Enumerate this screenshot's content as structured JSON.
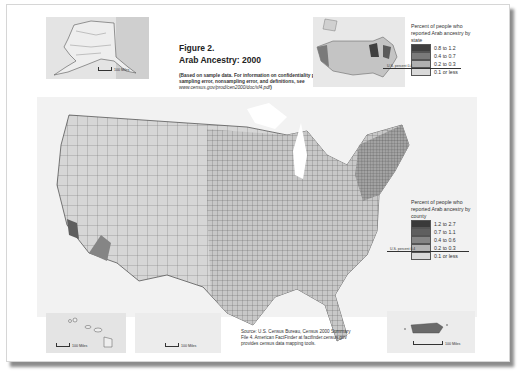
{
  "figure": {
    "number": "Figure 2.",
    "title": "Arab Ancestry: 2000",
    "note_bold": "(Based on sample data. For information on confidentiality protection, sampling error, nonsampling error, and definitions, see ",
    "note_url": "www.census.gov/prod/cen2000/doc/sf4.pdf",
    "note_end": ")"
  },
  "state_legend": {
    "title": "Percent of people who reported Arab ancestry by state",
    "us_percent_label": "U.S. percent 0.4",
    "classes": [
      {
        "label": "0.8 to 1.2",
        "color": "#3f3f3f"
      },
      {
        "label": "0.4 to 0.7",
        "color": "#7a7a7a"
      },
      {
        "label": "0.2 to 0.3",
        "color": "#b0b0b0"
      },
      {
        "label": "0.1 or less",
        "color": "#d9d9d9"
      }
    ]
  },
  "county_legend": {
    "title": "Percent of people who reported Arab ancestry by county",
    "us_percent_label": "U.S. percent 0.4",
    "classes": [
      {
        "label": "1.2 to 2.7",
        "color": "#3a3a3a"
      },
      {
        "label": "0.7 to 1.1",
        "color": "#5f5f5f"
      },
      {
        "label": "0.4 to 0.6",
        "color": "#858585"
      },
      {
        "label": "0.2 to 0.3",
        "color": "#b2b2b2"
      },
      {
        "label": "0.1 or less",
        "color": "#dadada"
      }
    ]
  },
  "source": "Source: U.S. Census Bureau, Census 2000 Summary File 4. American FactFinder at factfinder.census.gov provides census data mapping tools.",
  "insets": {
    "alaska_scale": "100 Miles",
    "hawaii_scale": "100 Miles",
    "texas_scale": "100 Miles",
    "puerto_rico_scale": "100 Miles"
  }
}
